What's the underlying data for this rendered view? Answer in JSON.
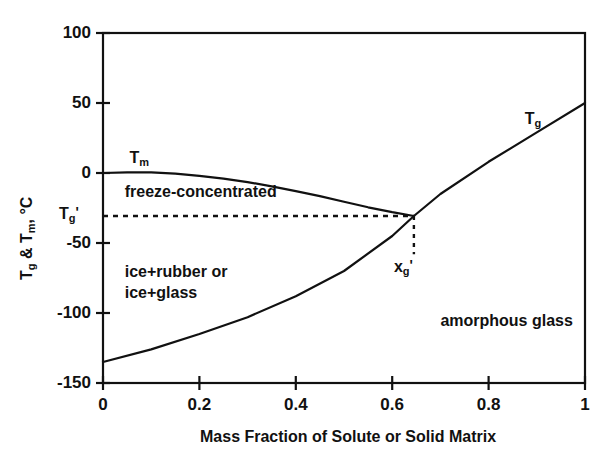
{
  "chart_data": {
    "type": "line",
    "title": "",
    "xlabel": "Mass Fraction of Solute or Solid Matrix",
    "ylabel": "Tg & Tm, °C",
    "xlim": [
      0,
      1
    ],
    "ylim": [
      -150,
      100
    ],
    "xticks": [
      "0",
      "0.2",
      "0.4",
      "0.6",
      "0.8",
      "1"
    ],
    "xtick_values": [
      0,
      0.2,
      0.4,
      0.6,
      0.8,
      1
    ],
    "yticks": [
      "100",
      "50",
      "0",
      "-50",
      "-100",
      "-150"
    ],
    "ytick_values": [
      100,
      50,
      0,
      -50,
      -100,
      -150
    ],
    "grid": false,
    "legend": "none",
    "series": [
      {
        "name": "Tm",
        "label": "Tm",
        "style": "solid",
        "points": [
          [
            0.0,
            0
          ],
          [
            0.05,
            0.5
          ],
          [
            0.1,
            0.5
          ],
          [
            0.15,
            -0.5
          ],
          [
            0.2,
            -2
          ],
          [
            0.25,
            -4
          ],
          [
            0.3,
            -6.5
          ],
          [
            0.35,
            -9.5
          ],
          [
            0.4,
            -13
          ],
          [
            0.45,
            -16.5
          ],
          [
            0.5,
            -20.5
          ],
          [
            0.55,
            -24.5
          ],
          [
            0.6,
            -28
          ],
          [
            0.645,
            -30.7
          ]
        ]
      },
      {
        "name": "Tg",
        "label": "Tg",
        "style": "solid",
        "points": [
          [
            0.0,
            -135
          ],
          [
            0.1,
            -126
          ],
          [
            0.2,
            -115
          ],
          [
            0.3,
            -103
          ],
          [
            0.4,
            -88
          ],
          [
            0.5,
            -70
          ],
          [
            0.6,
            -45
          ],
          [
            0.645,
            -30.7
          ],
          [
            0.7,
            -15
          ],
          [
            0.8,
            8
          ],
          [
            0.9,
            29
          ],
          [
            1.0,
            50
          ]
        ]
      }
    ],
    "reference_lines": [
      {
        "name": "Tg-prime-horizontal",
        "orientation": "horizontal",
        "style": "dashed",
        "value": -30.7,
        "from_x": 0,
        "to_x": 0.645,
        "label": "Tg'"
      },
      {
        "name": "xg-prime-vertical",
        "orientation": "vertical",
        "style": "dashed",
        "value": 0.645,
        "from_y": -30.7,
        "to_y": -58,
        "label": "xg'"
      }
    ],
    "annotations": [
      {
        "name": "tm-curve-label",
        "text": "Tm",
        "x": 0.055,
        "y": 9
      },
      {
        "name": "tg-curve-label",
        "text": "Tg",
        "x": 0.875,
        "y": 37
      },
      {
        "name": "freeze-concentrated",
        "text": "freeze-concentrated",
        "x": 0.045,
        "y": -15
      },
      {
        "name": "ice-rubber-glass-1",
        "text": "ice+rubber or",
        "x": 0.045,
        "y": -72
      },
      {
        "name": "ice-rubber-glass-2",
        "text": "ice+glass",
        "x": 0.045,
        "y": -87
      },
      {
        "name": "amorphous-glass",
        "text": "amorphous glass",
        "x": 0.7,
        "y": -107
      },
      {
        "name": "xg-prime-annotation",
        "text": "xg'",
        "x": 0.645,
        "y": -68
      }
    ]
  },
  "labels": {
    "y_axis_title": "Tg & Tm, °C",
    "x_axis_title": "Mass Fraction of Solute or Solid Matrix",
    "tg_prime_tick": "Tg'",
    "tm_label_base": "T",
    "tm_label_sub": "m",
    "tg_label_base": "T",
    "tg_label_sub": "g",
    "xg_label_base": "x",
    "xg_label_sub": "g",
    "prime_mark": "'",
    "freeze_concentrated": "freeze-concentrated",
    "ice_rubber": "ice+rubber or",
    "ice_glass": "ice+glass",
    "amorphous_glass": "amorphous glass",
    "y_title_part1": "T",
    "y_title_sub1": "g",
    "y_title_mid": " & T",
    "y_title_sub2": "m",
    "y_title_end": ", °C"
  },
  "colors": {
    "ink": "#111111",
    "background": "#ffffff"
  }
}
